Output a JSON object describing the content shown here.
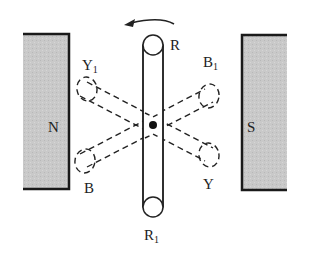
{
  "diagram": {
    "title": "",
    "magnets": {
      "north": {
        "label": "N",
        "color": "#c8c8c8"
      },
      "south": {
        "label": "S",
        "color": "#c8c8c8"
      }
    },
    "rotation_direction": "counterclockwise",
    "coils": [
      {
        "name": "R-R1",
        "start": "R",
        "end_base": "R",
        "end_sub": "1",
        "style": "solid"
      },
      {
        "name": "Y-Y1",
        "start": "Y",
        "end_base": "Y",
        "end_sub": "1",
        "style": "dashed"
      },
      {
        "name": "B-B1",
        "start": "B",
        "end_base": "B",
        "end_sub": "1",
        "style": "dashed"
      }
    ],
    "labels": {
      "R": "R",
      "R1_base": "R",
      "R1_sub": "1",
      "Y": "Y",
      "Y1_base": "Y",
      "Y1_sub": "1",
      "B": "B",
      "B1_base": "B",
      "B1_sub": "1",
      "N": "N",
      "S": "S"
    }
  }
}
